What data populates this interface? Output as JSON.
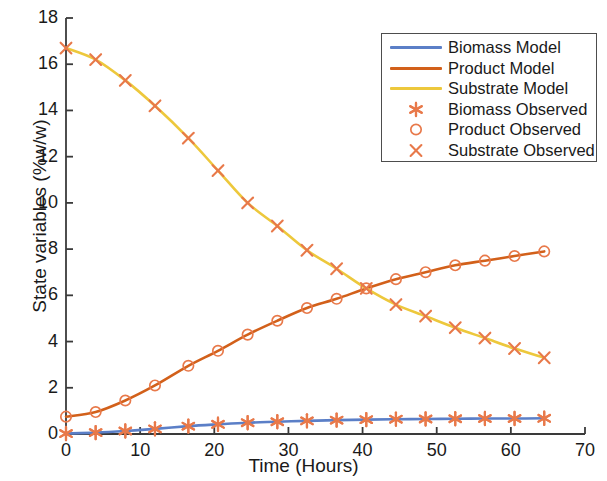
{
  "chart_data": {
    "type": "line",
    "title": "",
    "xlabel": "Time (Hours)",
    "ylabel": "State variables (%w/w)",
    "xlim": [
      0,
      70
    ],
    "ylim": [
      0,
      18
    ],
    "xticks": [
      0,
      10,
      20,
      30,
      40,
      50,
      60,
      70
    ],
    "yticks": [
      0,
      2,
      4,
      6,
      8,
      10,
      12,
      14,
      16,
      18
    ],
    "grid": false,
    "legend_position": "upper right",
    "x": [
      0,
      4,
      8,
      12,
      16.5,
      20.5,
      24.5,
      28.5,
      32.5,
      36.5,
      40.5,
      44.5,
      48.5,
      52.5,
      56.5,
      60.5,
      64.5
    ],
    "series": [
      {
        "name": "Biomass Model",
        "kind": "line",
        "color": "#5b7fc7",
        "values": [
          0.02,
          0.06,
          0.13,
          0.22,
          0.34,
          0.42,
          0.49,
          0.53,
          0.57,
          0.6,
          0.62,
          0.64,
          0.65,
          0.66,
          0.67,
          0.67,
          0.68
        ]
      },
      {
        "name": "Product Model",
        "kind": "line",
        "color": "#d2601a",
        "values": [
          0.75,
          0.95,
          1.45,
          2.1,
          2.95,
          3.6,
          4.3,
          4.9,
          5.45,
          5.85,
          6.3,
          6.7,
          7.0,
          7.3,
          7.5,
          7.7,
          7.9
        ]
      },
      {
        "name": "Substrate Model",
        "kind": "line",
        "color": "#edc83c",
        "values": [
          16.7,
          16.2,
          15.3,
          14.2,
          12.8,
          11.4,
          10.0,
          9.0,
          7.95,
          7.15,
          6.3,
          5.6,
          5.1,
          4.6,
          4.15,
          3.7,
          3.3
        ]
      },
      {
        "name": "Biomass Observed",
        "kind": "marker",
        "marker": "asterisk",
        "color": "#e8794a",
        "values": [
          0.02,
          0.06,
          0.13,
          0.22,
          0.34,
          0.42,
          0.49,
          0.53,
          0.57,
          0.6,
          0.62,
          0.64,
          0.65,
          0.66,
          0.67,
          0.67,
          0.68
        ]
      },
      {
        "name": "Product Observed",
        "kind": "marker",
        "marker": "circle",
        "color": "#e8794a",
        "values": [
          0.75,
          0.95,
          1.45,
          2.1,
          2.95,
          3.6,
          4.3,
          4.9,
          5.45,
          5.85,
          6.3,
          6.7,
          7.0,
          7.3,
          7.5,
          7.7,
          7.9
        ]
      },
      {
        "name": "Substrate Observed",
        "kind": "marker",
        "marker": "x",
        "color": "#e8794a",
        "values": [
          16.7,
          16.2,
          15.3,
          14.2,
          12.8,
          11.4,
          10.0,
          9.0,
          7.95,
          7.15,
          6.3,
          5.6,
          5.1,
          4.6,
          4.15,
          3.7,
          3.3
        ]
      }
    ],
    "legend": [
      {
        "label": "Biomass Model",
        "kind": "line",
        "color": "#5b7fc7"
      },
      {
        "label": "Product Model",
        "kind": "line",
        "color": "#d2601a"
      },
      {
        "label": "Substrate Model",
        "kind": "line",
        "color": "#edc83c"
      },
      {
        "label": "Biomass Observed",
        "kind": "marker",
        "marker": "asterisk",
        "color": "#e8794a"
      },
      {
        "label": "Product Observed",
        "kind": "marker",
        "marker": "circle",
        "color": "#e8794a"
      },
      {
        "label": "Substrate Observed",
        "kind": "marker",
        "marker": "x",
        "color": "#e8794a"
      }
    ],
    "axis_color": "#3a3a3a"
  }
}
